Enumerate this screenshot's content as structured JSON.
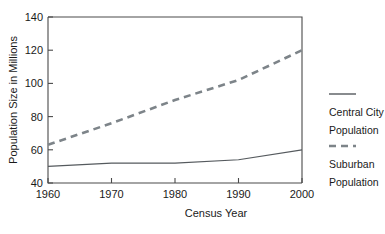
{
  "chart_data": {
    "type": "line",
    "title": "",
    "xlabel": "Census Year",
    "ylabel": "Population Size in Millions",
    "x": [
      1960,
      1970,
      1980,
      1990,
      2000
    ],
    "xticklabels": [
      "1960",
      "1970",
      "1980",
      "1990",
      "2000"
    ],
    "yticklabels": [
      "40",
      "60",
      "80",
      "100",
      "120",
      "140"
    ],
    "yticks": [
      40,
      60,
      80,
      100,
      120,
      140
    ],
    "xlim": [
      1960,
      2000
    ],
    "ylim": [
      40,
      140
    ],
    "grid": false,
    "legend_position": "right",
    "series": [
      {
        "name": "Central City Population",
        "style": "solid",
        "color": "#555a5e",
        "values": [
          50,
          52,
          52,
          54,
          60
        ]
      },
      {
        "name": "Suburban Population",
        "style": "dashed",
        "color": "#7d8489",
        "values": [
          63,
          76,
          90,
          102,
          120
        ]
      }
    ]
  },
  "axes": {
    "x_title": "Census Year",
    "y_title": "Population Size in Millions",
    "x_ticks": [
      "1960",
      "1970",
      "1980",
      "1990",
      "2000"
    ],
    "y_ticks": [
      "40",
      "60",
      "80",
      "100",
      "120",
      "140"
    ]
  },
  "legend": {
    "entries": [
      {
        "line1": "Central City",
        "line2": "Population",
        "style": "solid"
      },
      {
        "line1": "Suburban",
        "line2": "Population",
        "style": "dashed"
      }
    ]
  }
}
